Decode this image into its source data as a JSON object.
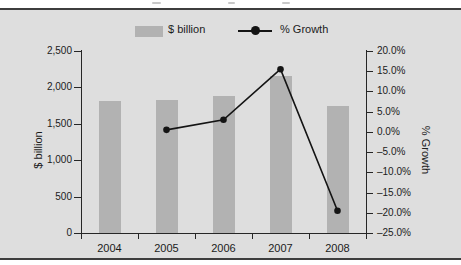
{
  "figure": {
    "background": "#ffffff",
    "panel_bg": "#dedede",
    "border_color": "#3d3d3d"
  },
  "colors": {
    "bar": "#b2b2b2",
    "line": "#141414",
    "axis": "#262626",
    "text": "#1b1b1b"
  },
  "legend": {
    "bar_label": "$ billion",
    "line_label": "% Growth"
  },
  "chart_data": {
    "type": "combo",
    "categories": [
      "2004",
      "2005",
      "2006",
      "2007",
      "2008"
    ],
    "series": [
      {
        "name": "$ billion",
        "type": "bar",
        "axis": "left",
        "values": [
          1820,
          1830,
          1880,
          2160,
          1740
        ]
      },
      {
        "name": "% Growth",
        "type": "line",
        "axis": "right",
        "values": [
          null,
          0.5,
          3.0,
          15.5,
          -19.5
        ]
      }
    ],
    "left_axis": {
      "label": "$ billion",
      "min": 0,
      "max": 2500,
      "step": 500,
      "tick_labels_top_to_bottom": [
        "2,500",
        "2,000",
        "1,500",
        "1,000",
        "500",
        "0"
      ]
    },
    "right_axis": {
      "label": "% Growth",
      "min": -25,
      "max": 20,
      "step": 5,
      "tick_labels_top_to_bottom": [
        "20.0%",
        "15.0%",
        "10.0%",
        "5.0%",
        "0.0%",
        "–5.0%",
        "–10.0%",
        "–15.0%",
        "–20.0%",
        "–25.0%"
      ]
    },
    "legend_position": "top",
    "grid": false
  }
}
